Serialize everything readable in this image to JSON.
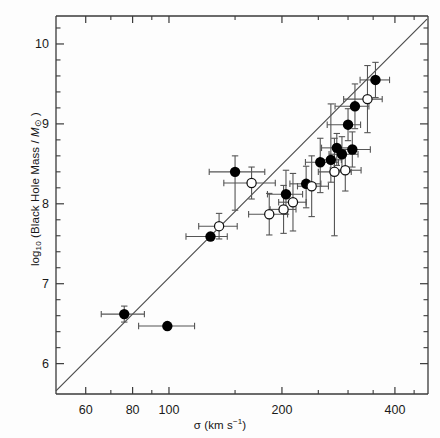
{
  "figure": {
    "background": "#fdfdfd",
    "ink": "#1a1a1a",
    "frame_color": "#3a3a3a",
    "marker_fill": "#000000",
    "errorbar_color": "#555555",
    "fitline_color": "#4a4a4a"
  },
  "axis_labels": {
    "x_title_prefix": "σ (km s",
    "x_title_exponent": "−1",
    "x_title_suffix": ")",
    "y_title_prefix": "log",
    "y_title_sub": "10",
    "y_title_main": " (Black Hole Mass / ",
    "y_title_italic": "M",
    "y_title_sun": "⊙",
    "y_title_suffix": " )"
  },
  "chart_data": {
    "type": "scatter",
    "title": "",
    "xlabel": "σ (km s⁻¹)",
    "ylabel": "log10 (Black Hole Mass / M☉)",
    "xscale": "log",
    "yscale": "linear",
    "xlim": [
      50,
      490
    ],
    "ylim": [
      5.62,
      10.35
    ],
    "grid": false,
    "legend": null,
    "x_ticks_major": [
      60,
      80,
      100,
      200,
      400
    ],
    "x_tick_labels": [
      "60",
      "80",
      "100",
      "200",
      "400"
    ],
    "x_ticks_minor": [
      70,
      90,
      150,
      250,
      300,
      350,
      450
    ],
    "y_ticks_major": [
      6,
      7,
      8,
      9,
      10
    ],
    "y_tick_labels": [
      "6",
      "7",
      "8",
      "9",
      "10"
    ],
    "y_ticks_minor": [
      6.2,
      6.4,
      6.6,
      6.8,
      7.2,
      7.4,
      7.6,
      7.8,
      8.2,
      8.4,
      8.6,
      8.8,
      9.2,
      9.4,
      9.6,
      9.8,
      10.2
    ],
    "fit_line": {
      "label": "best-fit relation",
      "x_start": 50,
      "y_start": 5.66,
      "x_end": 487,
      "y_end": 10.31
    },
    "series": [
      {
        "name": "filled",
        "marker": "filled-circle",
        "points": [
          {
            "x": 76,
            "y": 6.62,
            "xerr_lo": 10,
            "xerr_hi": 10,
            "yerr_lo": 0.1,
            "yerr_hi": 0.1
          },
          {
            "x": 99,
            "y": 6.47,
            "xerr_lo": 16,
            "xerr_hi": 18,
            "yerr_lo": 0.0,
            "yerr_hi": 0.0
          },
          {
            "x": 129,
            "y": 7.59,
            "xerr_lo": 18,
            "xerr_hi": 14,
            "yerr_lo": 0.0,
            "yerr_hi": 0.0
          },
          {
            "x": 150,
            "y": 8.4,
            "xerr_lo": 22,
            "xerr_hi": 30,
            "yerr_lo": 0.48,
            "yerr_hi": 0.2
          },
          {
            "x": 205,
            "y": 8.12,
            "xerr_lo": 22,
            "xerr_hi": 22,
            "yerr_lo": 0.25,
            "yerr_hi": 0.3
          },
          {
            "x": 232,
            "y": 8.25,
            "xerr_lo": 22,
            "xerr_hi": 22,
            "yerr_lo": 0.3,
            "yerr_hi": 0.22
          },
          {
            "x": 253,
            "y": 8.52,
            "xerr_lo": 22,
            "xerr_hi": 30,
            "yerr_lo": 0.38,
            "yerr_hi": 0.3
          },
          {
            "x": 270,
            "y": 8.55,
            "xerr_lo": 18,
            "xerr_hi": 18,
            "yerr_lo": 0.28,
            "yerr_hi": 0.7
          },
          {
            "x": 280,
            "y": 8.7,
            "xerr_lo": 25,
            "xerr_hi": 25,
            "yerr_lo": 0.22,
            "yerr_hi": 0.18
          },
          {
            "x": 289,
            "y": 8.62,
            "xerr_lo": 22,
            "xerr_hi": 30,
            "yerr_lo": 0.2,
            "yerr_hi": 0.22
          },
          {
            "x": 300,
            "y": 8.99,
            "xerr_lo": 36,
            "xerr_hi": 24,
            "yerr_lo": 0.2,
            "yerr_hi": 0.2
          },
          {
            "x": 308,
            "y": 8.68,
            "xerr_lo": 28,
            "xerr_hi": 36,
            "yerr_lo": 0.22,
            "yerr_hi": 0.22
          },
          {
            "x": 313,
            "y": 9.22,
            "xerr_lo": 36,
            "xerr_hi": 28,
            "yerr_lo": 0.28,
            "yerr_hi": 0.28
          },
          {
            "x": 355,
            "y": 9.55,
            "xerr_lo": 32,
            "xerr_hi": 32,
            "yerr_lo": 0.22,
            "yerr_hi": 0.22
          }
        ]
      },
      {
        "name": "open",
        "marker": "open-circle",
        "points": [
          {
            "x": 136,
            "y": 7.72,
            "xerr_lo": 16,
            "xerr_hi": 16,
            "yerr_lo": 0.16,
            "yerr_hi": 0.16
          },
          {
            "x": 166,
            "y": 8.26,
            "xerr_lo": 26,
            "xerr_hi": 26,
            "yerr_lo": 0.2,
            "yerr_hi": 0.2
          },
          {
            "x": 185,
            "y": 7.87,
            "xerr_lo": 22,
            "xerr_hi": 22,
            "yerr_lo": 0.26,
            "yerr_hi": 0.26
          },
          {
            "x": 202,
            "y": 7.93,
            "xerr_lo": 16,
            "xerr_hi": 16,
            "yerr_lo": 0.3,
            "yerr_hi": 0.3
          },
          {
            "x": 214,
            "y": 8.02,
            "xerr_lo": 18,
            "xerr_hi": 18,
            "yerr_lo": 0.36,
            "yerr_hi": 0.36
          },
          {
            "x": 240,
            "y": 8.22,
            "xerr_lo": 20,
            "xerr_hi": 26,
            "yerr_lo": 0.38,
            "yerr_hi": 0.38
          },
          {
            "x": 276,
            "y": 8.4,
            "xerr_lo": 26,
            "xerr_hi": 30,
            "yerr_lo": 0.8,
            "yerr_hi": 0.42
          },
          {
            "x": 295,
            "y": 8.42,
            "xerr_lo": 26,
            "xerr_hi": 30,
            "yerr_lo": 0.26,
            "yerr_hi": 0.26
          },
          {
            "x": 338,
            "y": 9.31,
            "xerr_lo": 46,
            "xerr_hi": 32,
            "yerr_lo": 0.42,
            "yerr_hi": 0.42
          }
        ]
      }
    ]
  }
}
